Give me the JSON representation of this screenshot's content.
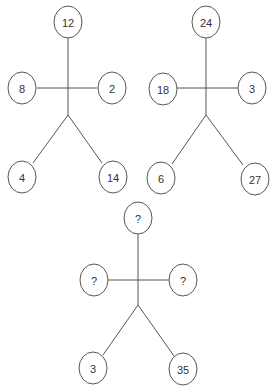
{
  "puzzle": {
    "figures": [
      {
        "id": "figure-1",
        "head": "12",
        "left_hand": "8",
        "right_hand": "2",
        "left_foot": "4",
        "right_foot": "14"
      },
      {
        "id": "figure-2",
        "head": "24",
        "left_hand": "18",
        "right_hand": "3",
        "left_foot": "6",
        "right_foot": "27"
      },
      {
        "id": "figure-3",
        "head": "?",
        "left_hand": "?",
        "right_hand": "?",
        "left_foot": "3",
        "right_foot": "35"
      }
    ]
  }
}
